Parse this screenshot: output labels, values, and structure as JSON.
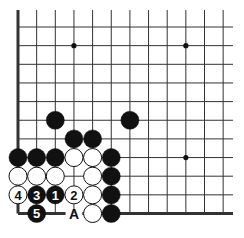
{
  "diagram": {
    "type": "go-board-partial",
    "colors": {
      "black": "#111111",
      "white": "#ffffff",
      "line": "#333333",
      "background": "#ffffff"
    },
    "grid": {
      "x0": 18,
      "y0": 27,
      "step": 18.65,
      "cols": 12,
      "rows": 11,
      "right_extent": 233,
      "top_extent": 10,
      "left_edge_thick": true,
      "bottom_edge_thick": true
    },
    "star_points": [
      {
        "c": 3,
        "r": 1
      },
      {
        "c": 9,
        "r": 1
      },
      {
        "c": 9,
        "r": 7
      }
    ],
    "stones": [
      {
        "c": 2,
        "r": 5,
        "color": "black",
        "label": ""
      },
      {
        "c": 6,
        "r": 5,
        "color": "black",
        "label": ""
      },
      {
        "c": 3,
        "r": 6,
        "color": "black",
        "label": ""
      },
      {
        "c": 4,
        "r": 6,
        "color": "black",
        "label": ""
      },
      {
        "c": 0,
        "r": 7,
        "color": "black",
        "label": ""
      },
      {
        "c": 1,
        "r": 7,
        "color": "black",
        "label": ""
      },
      {
        "c": 2,
        "r": 7,
        "color": "black",
        "label": ""
      },
      {
        "c": 3,
        "r": 7,
        "color": "white",
        "label": ""
      },
      {
        "c": 4,
        "r": 7,
        "color": "white",
        "label": ""
      },
      {
        "c": 5,
        "r": 7,
        "color": "black",
        "label": ""
      },
      {
        "c": 0,
        "r": 8,
        "color": "white",
        "label": ""
      },
      {
        "c": 1,
        "r": 8,
        "color": "white",
        "label": ""
      },
      {
        "c": 2,
        "r": 8,
        "color": "white",
        "label": ""
      },
      {
        "c": 4,
        "r": 8,
        "color": "white",
        "label": ""
      },
      {
        "c": 5,
        "r": 8,
        "color": "black",
        "label": ""
      },
      {
        "c": 0,
        "r": 9,
        "color": "white",
        "label": "4"
      },
      {
        "c": 1,
        "r": 9,
        "color": "black",
        "label": "3"
      },
      {
        "c": 2,
        "r": 9,
        "color": "black",
        "label": "1"
      },
      {
        "c": 3,
        "r": 9,
        "color": "white",
        "label": "2"
      },
      {
        "c": 4,
        "r": 9,
        "color": "white",
        "label": ""
      },
      {
        "c": 5,
        "r": 9,
        "color": "black",
        "label": ""
      },
      {
        "c": 1,
        "r": 10,
        "color": "black",
        "label": "5"
      },
      {
        "c": 4,
        "r": 10,
        "color": "white",
        "label": ""
      },
      {
        "c": 5,
        "r": 10,
        "color": "black",
        "label": ""
      }
    ],
    "point_labels": [
      {
        "c": 3,
        "r": 10,
        "text": "A"
      }
    ]
  }
}
